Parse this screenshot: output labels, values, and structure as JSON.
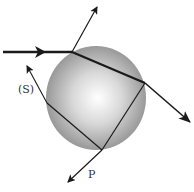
{
  "diagram": {
    "labels": {
      "s": "(S)",
      "p": "P"
    },
    "colors": {
      "ray": "#1a1a1a",
      "sphere_light": "#ffffff",
      "sphere_mid": "#d0d0d0",
      "sphere_dark": "#8c8c8c",
      "label": "#333333"
    },
    "sphere": {
      "cx": 96,
      "cy": 98,
      "rx": 50,
      "ry": 52
    },
    "rays": [
      {
        "name": "incident-ray",
        "from": [
          3,
          52
        ],
        "to": [
          72,
          52
        ]
      },
      {
        "name": "reflected-ray",
        "from": [
          72,
          52
        ],
        "to": [
          97,
          7
        ]
      },
      {
        "name": "internal-ray-1",
        "from": [
          72,
          52
        ],
        "to": [
          145,
          83
        ]
      },
      {
        "name": "transmitted-ray-1",
        "from": [
          145,
          83
        ],
        "to": [
          190,
          122
        ]
      },
      {
        "name": "internal-ray-2",
        "from": [
          145,
          83
        ],
        "to": [
          102,
          150
        ]
      },
      {
        "name": "transmitted-ray-p",
        "from": [
          102,
          150
        ],
        "to": [
          68,
          182
        ]
      },
      {
        "name": "internal-ray-3",
        "from": [
          102,
          150
        ],
        "to": [
          47,
          103
        ]
      },
      {
        "name": "transmitted-ray-s",
        "from": [
          47,
          103
        ],
        "to": [
          27,
          66
        ]
      }
    ]
  }
}
